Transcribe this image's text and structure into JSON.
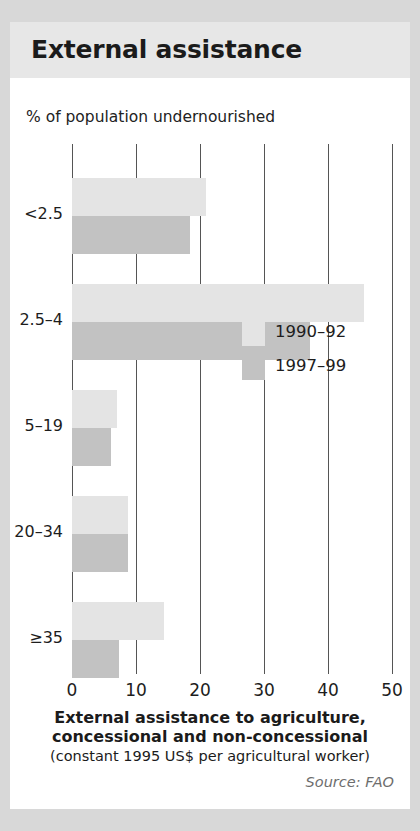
{
  "card": {
    "title": "External assistance"
  },
  "chart_data": {
    "type": "bar",
    "orientation": "horizontal",
    "title": "External assistance",
    "subtitle": "% of population undernourished",
    "ylabel": "% of population undernourished",
    "xlabel": "External assistance to agriculture, concessional and non-concessional",
    "xlabel_sub": "(constant 1995 US$ per agricultural worker)",
    "categories": [
      "<2.5",
      "2.5–4",
      "5–19",
      "20–34",
      "≥35"
    ],
    "series": [
      {
        "name": "1990–92",
        "color": "#e4e4e4",
        "values": [
          21.0,
          45.7,
          7.0,
          8.8,
          14.4
        ]
      },
      {
        "name": "1997–99",
        "color": "#c2c2c2",
        "values": [
          18.5,
          37.2,
          6.1,
          8.8,
          7.4
        ]
      }
    ],
    "xlim": [
      0,
      50
    ],
    "xticks": [
      0,
      10,
      20,
      30,
      40,
      50
    ],
    "xtick_labels": [
      "0",
      "10",
      "20",
      "30",
      "40",
      "50"
    ],
    "grid": "vertical",
    "legend_position": "center-right",
    "source": "Source: FAO"
  },
  "footer": {
    "caption_line1": "External assistance to agriculture,",
    "caption_line2": "concessional and non-concessional",
    "units": "(constant 1995 US$ per agricultural worker)",
    "source": "Source: FAO"
  }
}
